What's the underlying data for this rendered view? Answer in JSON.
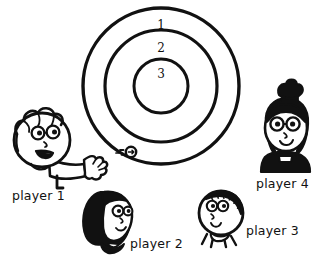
{
  "illustration": {
    "title": "target-with-four-players",
    "style": "black-and-white cartoon line drawing",
    "ink_color": "#111111",
    "paper_color": "#ffffff"
  },
  "target": {
    "name": "concentric-ring-target",
    "center": {
      "x": 161,
      "y": 86
    },
    "rings": [
      {
        "label": "1",
        "radius": 78,
        "label_x": 161,
        "label_y": 29
      },
      {
        "label": "2",
        "radius": 56,
        "label_x": 161,
        "label_y": 52
      },
      {
        "label": "3",
        "radius": 27,
        "label_x": 161,
        "label_y": 78
      }
    ]
  },
  "projectile": {
    "name": "thrown-disc",
    "x": 131,
    "y": 152,
    "radius": 5,
    "motion_lines": 3
  },
  "players": [
    {
      "id": "player-1",
      "label": "player 1",
      "label_x": 12,
      "label_y": 200,
      "head_x": 40,
      "head_y": 138,
      "hair": "curly",
      "has_glasses": true,
      "mouth": "open-smile",
      "has_arm": true,
      "clothing_fill": "#ffffff"
    },
    {
      "id": "player-2",
      "label": "player 2",
      "label_x": 130,
      "label_y": 248,
      "head_x": 104,
      "head_y": 220,
      "hair": "black-bob",
      "has_glasses": true,
      "mouth": "small-smile",
      "has_arm": false,
      "clothing_fill": "#111111"
    },
    {
      "id": "player-3",
      "label": "player 3",
      "label_x": 246,
      "label_y": 235,
      "head_x": 221,
      "head_y": 215,
      "hair": "curly-headband",
      "has_glasses": true,
      "mouth": "small-smile",
      "has_arm": false,
      "clothing_fill": "#ffffff"
    },
    {
      "id": "player-4",
      "label": "player 4",
      "label_x": 256,
      "label_y": 188,
      "head_x": 285,
      "head_y": 128,
      "hair": "black-bun",
      "has_glasses": true,
      "mouth": "small-smile",
      "has_arm": false,
      "clothing_fill": "#111111"
    }
  ]
}
